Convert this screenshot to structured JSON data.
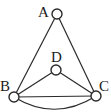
{
  "diagram": {
    "type": "graph",
    "nodes": [
      {
        "id": "A",
        "label": "A",
        "x": 57,
        "y": 14
      },
      {
        "id": "B",
        "label": "B",
        "x": 14,
        "y": 97
      },
      {
        "id": "C",
        "label": "C",
        "x": 96,
        "y": 96
      },
      {
        "id": "D",
        "label": "D",
        "x": 56,
        "y": 70
      }
    ],
    "edges": [
      {
        "from": "A",
        "to": "B",
        "style": "straight"
      },
      {
        "from": "A",
        "to": "C",
        "style": "straight"
      },
      {
        "from": "B",
        "to": "D",
        "style": "straight"
      },
      {
        "from": "D",
        "to": "C",
        "style": "straight"
      },
      {
        "from": "B",
        "to": "C",
        "style": "straight"
      },
      {
        "from": "B",
        "to": "C",
        "style": "curved"
      }
    ],
    "colors": {
      "stroke": "#2a2a2a",
      "node_fill": "#ffffff",
      "background": "#ffffff"
    }
  }
}
